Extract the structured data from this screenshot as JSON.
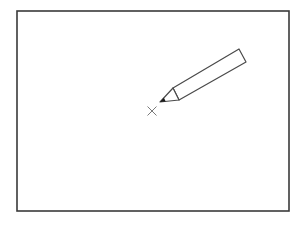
{
  "figure": {
    "frame": {
      "x": 17,
      "y": 11,
      "width": 272,
      "height": 200,
      "stroke": "#3a3a3a"
    },
    "target_mark": {
      "icon": "cross-mark-icon",
      "cx": 152,
      "cy": 111,
      "half_size": 4.5,
      "stroke": "#7a7a7a"
    },
    "pencil": {
      "icon": "pencil-icon",
      "stroke": "#4a4a4a",
      "fill": "#ffffff",
      "lead_color": "#1a1a1a",
      "tip": [
        160,
        102
      ],
      "cone_base_top": [
        173,
        88
      ],
      "cone_base_bottom": [
        179,
        100
      ],
      "end_top": [
        239,
        49
      ],
      "end_bottom": [
        246,
        62
      ]
    }
  }
}
